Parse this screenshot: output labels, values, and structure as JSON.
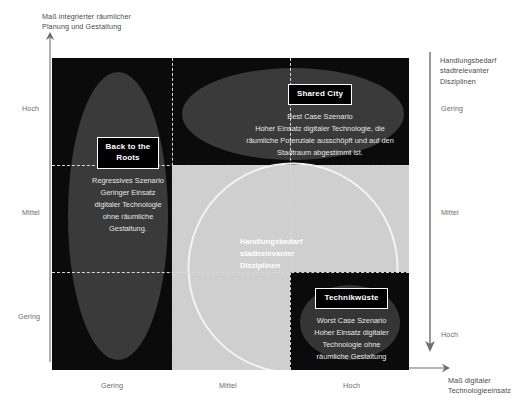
{
  "axes": {
    "y_left_caption": "Maß integrierter räumlicher\nPlanung und Gestaltung",
    "x_bottom_caption": "Maß digitaler\nTechnologieeinsatz",
    "y_right_caption": "Handlungsbedarf\nstadtrelevanter\nDisziplinen",
    "left_ticks": {
      "high": "Hoch",
      "mid": "Mittel",
      "low": "Gering"
    },
    "bottom_ticks": {
      "low": "Gering",
      "mid": "Mittel",
      "high": "Hoch"
    },
    "right_ticks": {
      "low": "Gering",
      "mid": "Mittel",
      "high": "Hoch"
    }
  },
  "center": {
    "label": "Handlungsbedarf\nstadtrelevanter\nDisziplinen"
  },
  "scenarios": [
    {
      "id": "back-to-the-roots",
      "badge": "Back to the\nRoots",
      "description": "Regressives Szenario\nGeringer Einsatz\ndigitaler Technologie\nohne räumliche\nGestaltung."
    },
    {
      "id": "shared-city",
      "badge": "Shared City",
      "description": "Best Case Szenario\nHoher Einsatz digitaler Technologie, die\nräumliche Potenziale ausschöpft und auf den\nStadtraum abgestimmt ist."
    },
    {
      "id": "technikwueste",
      "badge": "Technikwüste",
      "description": "Worst Case Szenario\nHoher Einsatz digitaler\nTechnologie ohne\nräumliche Gestaltung"
    }
  ],
  "colors": {
    "plot_background": "#0b0b0b",
    "need_block": "#cfcfcf",
    "ellipse": "#3a3a3a",
    "circle_outline": "#f3f3f3",
    "divider": "#d8d8d8",
    "text_light": "#e6e6e6",
    "page_background": "#ffffff"
  }
}
